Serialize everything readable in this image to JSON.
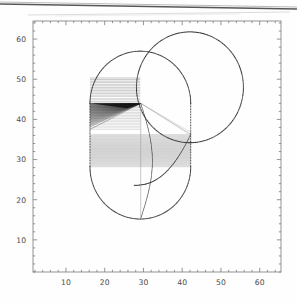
{
  "figure": {
    "title": "",
    "background_color": "#fefefe",
    "frame_color": "#7a7a7a",
    "ink_color": "#2b2b2b",
    "hatch_color": "#8d8d8d"
  },
  "chart_data": {
    "type": "scatter",
    "title": "",
    "xlabel": "",
    "ylabel": "",
    "xlim": [
      1.5,
      65.5
    ],
    "ylim": [
      2.0,
      64.5
    ],
    "grid": false,
    "legend": null,
    "x_ticks": [
      10,
      20,
      30,
      40,
      50,
      60
    ],
    "y_ticks": [
      10,
      20,
      30,
      40,
      50,
      60
    ],
    "x_tick_labels": [
      "10",
      "20",
      "30",
      "40",
      "50",
      "60"
    ],
    "y_tick_labels": [
      "10",
      "20",
      "30",
      "40",
      "50",
      "60"
    ],
    "minor_tick_step": 2,
    "series": [
      {
        "name": "big-circle",
        "kind": "circle-outline-dotted",
        "center": [
          42.0,
          48.0
        ],
        "radius": 13.8,
        "stroke": "#2b2b2b"
      },
      {
        "name": "stadium-outline",
        "kind": "rounded-capsule-outline-dotted",
        "x_left": 16.2,
        "x_right": 42.2,
        "y_bottom": 28.2,
        "y_top": 44.0,
        "cap_radius": 13.0,
        "stroke": "#2b2b2b"
      },
      {
        "name": "upper-band-hatch",
        "kind": "horizontal-hatch-band",
        "x_left": 16.2,
        "x_right": 29.2,
        "y_bottom": 37.5,
        "y_top": 50.3,
        "line_count": 34,
        "stroke": "#8d8d8d"
      },
      {
        "name": "lower-band-hatch",
        "kind": "horizontal-hatch-band",
        "x_left": 16.2,
        "x_right": 42.2,
        "y_bottom": 28.2,
        "y_top": 36.3,
        "line_count": 44,
        "stroke": "#9a9a9a"
      },
      {
        "name": "upper-fan",
        "kind": "radial-line-fan",
        "apex": [
          29.3,
          44.0
        ],
        "arc_x": 16.2,
        "arc_y_from": 37.5,
        "arc_y_to": 44.0,
        "line_count": 40,
        "stroke": "#303030"
      },
      {
        "name": "right-fan",
        "kind": "radial-line-fan",
        "apex": [
          29.3,
          44.0
        ],
        "target_x": 42.2,
        "target_y": 36.3,
        "line_count": 3,
        "stroke": "#9a9a9a"
      },
      {
        "name": "inner-arc-left",
        "kind": "arc",
        "points": "29.3,44.0 -> 31.8,32.0 -> 29.3,15.3",
        "stroke": "#2b2b2b"
      },
      {
        "name": "inner-arc-right",
        "kind": "arc",
        "points": "42.2,36.3 -> 35.0,32.5 -> 28.0,24.0",
        "stroke": "#2b2b2b"
      },
      {
        "name": "chord-bottom",
        "kind": "line",
        "from": [
          29.3,
          44.0
        ],
        "to": [
          29.3,
          15.3
        ],
        "stroke": "#9a9a9a"
      }
    ]
  },
  "annotations": {
    "scan_artifact_top": "dark diagonal scan line across top of page"
  }
}
